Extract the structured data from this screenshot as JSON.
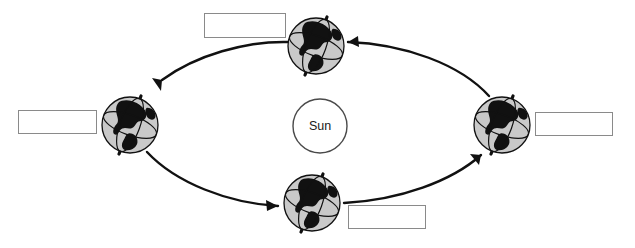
{
  "diagram": {
    "background_color": "#ffffff",
    "center_body": {
      "name": "Sun",
      "label": "Sun",
      "cx": 320,
      "cy": 126,
      "r": 27,
      "fill": "#ffffff",
      "stroke": "#4a4a4a"
    },
    "orbit": {
      "shape": "ellipse",
      "cx": 318,
      "cy": 125,
      "rx": 190,
      "ry": 88,
      "stroke": "#111111",
      "direction": "counterclockwise",
      "arrow_count": 4
    },
    "earth_positions": [
      {
        "id": "earth-top",
        "position_name": "top",
        "cx": 316,
        "cy": 46,
        "r": 28,
        "axis_tilt_deg": 20,
        "sphere_fill": "#c9c9c9",
        "land_fill": "#111111"
      },
      {
        "id": "earth-left",
        "position_name": "left",
        "cx": 130,
        "cy": 125,
        "r": 28,
        "axis_tilt_deg": 20,
        "sphere_fill": "#c9c9c9",
        "land_fill": "#111111"
      },
      {
        "id": "earth-bottom",
        "position_name": "bottom",
        "cx": 312,
        "cy": 203,
        "r": 28,
        "axis_tilt_deg": 20,
        "sphere_fill": "#c9c9c9",
        "land_fill": "#111111"
      },
      {
        "id": "earth-right",
        "position_name": "right",
        "cx": 502,
        "cy": 125,
        "r": 28,
        "axis_tilt_deg": 20,
        "sphere_fill": "#c9c9c9",
        "land_fill": "#111111"
      }
    ],
    "answer_boxes": [
      {
        "id": "label-box-top",
        "position_name": "top",
        "value": "",
        "border_color": "#8a8a8a"
      },
      {
        "id": "label-box-left",
        "position_name": "left",
        "value": "",
        "border_color": "#8a8a8a"
      },
      {
        "id": "label-box-right",
        "position_name": "right",
        "value": "",
        "border_color": "#8a8a8a"
      },
      {
        "id": "label-box-bottom",
        "position_name": "bottom",
        "value": "",
        "border_color": "#8a8a8a"
      }
    ]
  }
}
